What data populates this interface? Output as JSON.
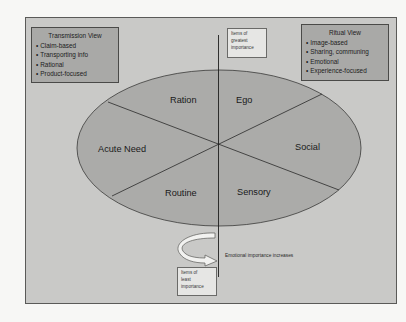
{
  "transmission_view": {
    "title": "Transmission View",
    "items": [
      "Claim-based",
      "Transporting info",
      "Rational",
      "Product-focused"
    ]
  },
  "ritual_view": {
    "title": "Ritual View",
    "items": [
      "Image-based",
      "Sharing, communing",
      "Emotional",
      "Experience-focused"
    ]
  },
  "axis": {
    "top_label": "Items of greatest importance",
    "top_lines": [
      "Items of",
      "greatest",
      "importance"
    ],
    "bottom_label": "Items of least importance",
    "bottom_lines": [
      "Items of",
      "least",
      "importance"
    ],
    "caption": "Emotional importance increases"
  },
  "segments": {
    "ration": "Ration",
    "ego": "Ego",
    "acute_need": "Acute Need",
    "social": "Social",
    "routine": "Routine",
    "sensory": "Sensory"
  },
  "colors": {
    "background": "#f7f7f5",
    "frame_fill": "#c9c9c7",
    "box_fill": "#a9a9a7",
    "ellipse_fill": "#ababa9",
    "label_box_fill": "#e6e6e4",
    "line": "#2a2a2a"
  }
}
